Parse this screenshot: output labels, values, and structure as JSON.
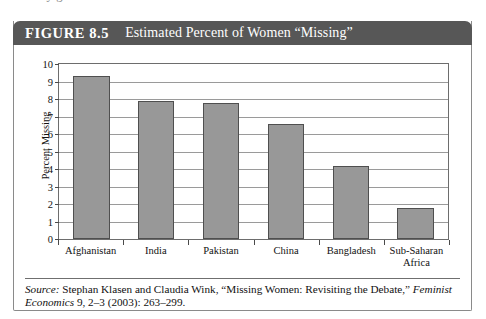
{
  "page": {
    "top_text_sliver": "s        t            t              y              g"
  },
  "figure": {
    "number_label": "FIGURE 8.5",
    "title": "Estimated Percent of Women “Missing”",
    "header_bg": "#575757",
    "header_text_color": "#ffffff"
  },
  "chart_data": {
    "type": "bar",
    "title": "Estimated Percent of Women “Missing”",
    "categories": [
      "Afghanistan",
      "India",
      "Pakistan",
      "China",
      "Bangladesh",
      "Sub-Saharan Africa"
    ],
    "category_label_lines": [
      [
        "Afghanistan"
      ],
      [
        "India"
      ],
      [
        "Pakistan"
      ],
      [
        "China"
      ],
      [
        "Bangladesh"
      ],
      [
        "Sub-Saharan",
        "Africa"
      ]
    ],
    "values": [
      9.3,
      7.9,
      7.8,
      6.6,
      4.15,
      1.75
    ],
    "xlabel": "",
    "ylabel": "Percent Missing",
    "ylim": [
      0,
      10
    ],
    "yticks": [
      0,
      1,
      2,
      3,
      4,
      5,
      6,
      7,
      8,
      9,
      10
    ],
    "ytick_labels": [
      "0",
      "1",
      "2",
      "3",
      "4",
      "5",
      "6",
      "7",
      "8",
      "9",
      "10"
    ],
    "grid": true,
    "legend": false,
    "bar_color": "#989898",
    "bar_border_color": "#4f4f4f",
    "grid_color": "#9a9a9a"
  },
  "source": {
    "label": "Source:",
    "text_part1": " Stephan Klasen and Claudia Wink, “Missing Women: Revisiting the Debate,” ",
    "journal": "Feminist Economics",
    "text_part2": " 9, 2–3 (2003): 263–299."
  }
}
